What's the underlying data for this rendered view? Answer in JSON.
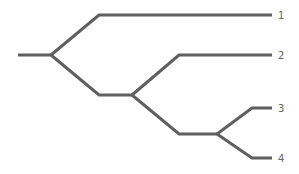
{
  "diagram": {
    "type": "cladogram",
    "line_color": "#5f5f5f",
    "label_color": "#666666",
    "leaves": [
      {
        "label": "1"
      },
      {
        "label": "2"
      },
      {
        "label": "3"
      },
      {
        "label": "4"
      }
    ],
    "structure": "((1,(2,(3,4))))"
  }
}
